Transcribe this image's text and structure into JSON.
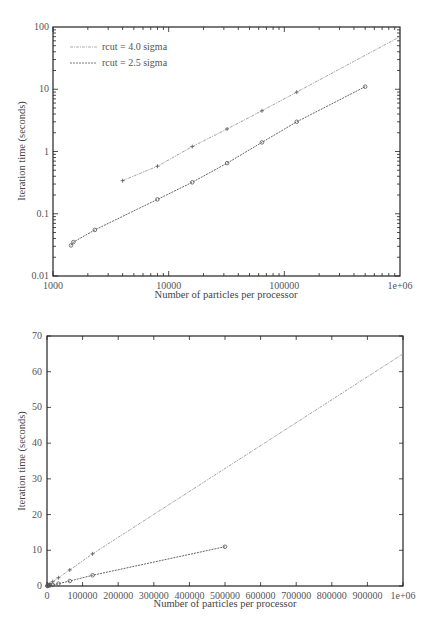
{
  "chart_data": [
    {
      "type": "line",
      "title": "",
      "xscale": "log",
      "yscale": "log",
      "xlabel": "Number of particles per processor",
      "ylabel": "Iteration time (seconds)",
      "xlim": [
        1000,
        1000000
      ],
      "ylim": [
        0.01,
        100
      ],
      "x_tick_labels": [
        "1000",
        "10000",
        "100000",
        "1e+06"
      ],
      "y_tick_labels": [
        "0.01",
        "0.1",
        "1",
        "10",
        "100"
      ],
      "grid": false,
      "legend_position": "upper left",
      "series": [
        {
          "name": "rcut = 4.0 sigma",
          "x": [
            4000,
            8000,
            16000,
            32000,
            64000,
            128000
          ],
          "values": [
            0.34,
            0.58,
            1.2,
            2.3,
            4.5,
            9.0
          ],
          "fit_line_to": [
            1000000,
            70
          ]
        },
        {
          "name": "rcut = 2.5 sigma",
          "x": [
            1430,
            1500,
            2300,
            8000,
            16000,
            32000,
            64000,
            128000,
            500000
          ],
          "values": [
            0.031,
            0.035,
            0.055,
            0.17,
            0.32,
            0.65,
            1.4,
            3.0,
            11
          ]
        }
      ]
    },
    {
      "type": "line",
      "title": "",
      "xscale": "linear",
      "yscale": "linear",
      "xlabel": "Number of particles per processor",
      "ylabel": "Iteration time (seconds)",
      "xlim": [
        0,
        1000000
      ],
      "ylim": [
        0,
        70
      ],
      "x_tick_labels": [
        "0",
        "100000",
        "200000",
        "300000",
        "400000",
        "500000",
        "600000",
        "700000",
        "800000",
        "900000",
        "1e+06"
      ],
      "y_tick_labels": [
        "0",
        "10",
        "20",
        "30",
        "40",
        "50",
        "60",
        "70"
      ],
      "grid": false,
      "series": [
        {
          "name": "rcut = 4.0 sigma",
          "x": [
            4000,
            8000,
            16000,
            32000,
            64000,
            128000
          ],
          "values": [
            0.34,
            0.58,
            1.2,
            2.3,
            4.5,
            9.0
          ],
          "fit_line_to": [
            1000000,
            65
          ]
        },
        {
          "name": "rcut = 2.5 sigma",
          "x": [
            1430,
            1500,
            2300,
            8000,
            16000,
            32000,
            64000,
            128000,
            500000
          ],
          "values": [
            0.031,
            0.035,
            0.055,
            0.17,
            0.32,
            0.65,
            1.4,
            3.0,
            11
          ]
        }
      ]
    }
  ],
  "colors": {
    "axis": "#222222",
    "series_upper": "#888888",
    "series_lower": "#555555"
  }
}
